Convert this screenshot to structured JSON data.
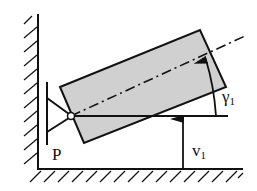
{
  "diagram": {
    "labels": {
      "pivot": "P",
      "rotation_symbol": "γ",
      "rotation_subscript": "1",
      "translation_symbol": "v",
      "translation_subscript": "1"
    },
    "colors": {
      "line": "#111111",
      "body_fill": "#d0d0d0",
      "background": "#ffffff"
    }
  }
}
